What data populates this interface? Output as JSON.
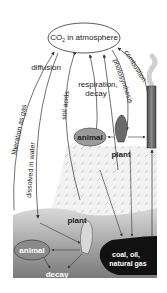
{
  "diagram": {
    "atmosphere": {
      "label_prefix": "CO",
      "label_sub": "2",
      "label_suffix": " in atmosphere"
    },
    "processes": {
      "diffusion": "diffusion",
      "respiration_line1": "respiration,",
      "respiration_line2": "decay",
      "combustion": "combustion",
      "photosynthesis": "photosynthesis",
      "liberation": "liberation as gas",
      "dissolved": "dissolved in water",
      "soil_acids": "soil acids",
      "decay": "decay"
    },
    "land": {
      "animal": "animal",
      "plant": "plant"
    },
    "water": {
      "animal": "animal",
      "plant": "plant"
    },
    "fossil": {
      "line1": "coal, oil,",
      "line2": "natural gas"
    },
    "colors": {
      "line": "#333333",
      "soil_pattern": "#d6d6d6",
      "water_light": "#c8c8c8",
      "water_dark": "#8a8a8a",
      "animal_fill": "#9a9a9a",
      "fossil": "#111111",
      "chimney": "#6e6e6e"
    }
  }
}
